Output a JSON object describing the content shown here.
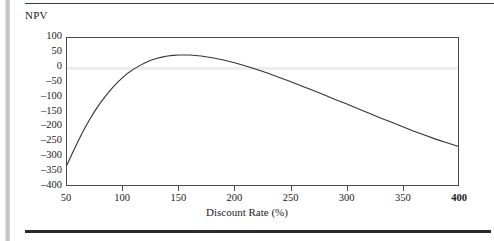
{
  "page": {
    "rule_top": "horizontal-rule",
    "rule_bottom": "horizontal-rule",
    "edge_bar": "page-edge-shadow"
  },
  "chart_data": {
    "type": "line",
    "title": "",
    "xlabel": "Discount Rate (%)",
    "ylabel": "NPV",
    "xlim": [
      50,
      400
    ],
    "ylim": [
      -400,
      100
    ],
    "grid": false,
    "legend": null,
    "zero_line": true,
    "x_ticks": [
      50,
      100,
      150,
      200,
      250,
      300,
      350,
      400
    ],
    "x_tick_labels": [
      "50",
      "100",
      "150",
      "200",
      "250",
      "300",
      "350",
      "400"
    ],
    "x_tick_label_bold": [
      false,
      false,
      false,
      false,
      false,
      false,
      false,
      true
    ],
    "y_ticks": [
      100,
      50,
      0,
      -50,
      -100,
      -150,
      -200,
      -250,
      -300,
      -350,
      -400
    ],
    "y_tick_labels": [
      "100",
      "50",
      "0",
      "–50",
      "–100",
      "–150",
      "–200",
      "–250",
      "–300",
      "–350",
      "–400"
    ],
    "series": [
      {
        "name": "NPV",
        "color": "#333333",
        "x": [
          50,
          55,
          60,
          65,
          70,
          75,
          80,
          85,
          90,
          95,
          100,
          105,
          110,
          115,
          120,
          125,
          130,
          135,
          140,
          145,
          150,
          160,
          170,
          180,
          190,
          200,
          210,
          220,
          230,
          240,
          250,
          260,
          270,
          280,
          290,
          300,
          310,
          320,
          330,
          340,
          350,
          360,
          370,
          380,
          390,
          400
        ],
        "y": [
          -332,
          -290,
          -250,
          -213,
          -179,
          -148,
          -120,
          -95,
          -72,
          -52,
          -34,
          -18,
          -5,
          6,
          16,
          24,
          30,
          35,
          39,
          41,
          42,
          42,
          39,
          33,
          25,
          16,
          5,
          -7,
          -20,
          -34,
          -48,
          -63,
          -78,
          -93,
          -109,
          -124,
          -140,
          -155,
          -171,
          -186,
          -201,
          -216,
          -230,
          -244,
          -256,
          -268
        ]
      }
    ]
  }
}
